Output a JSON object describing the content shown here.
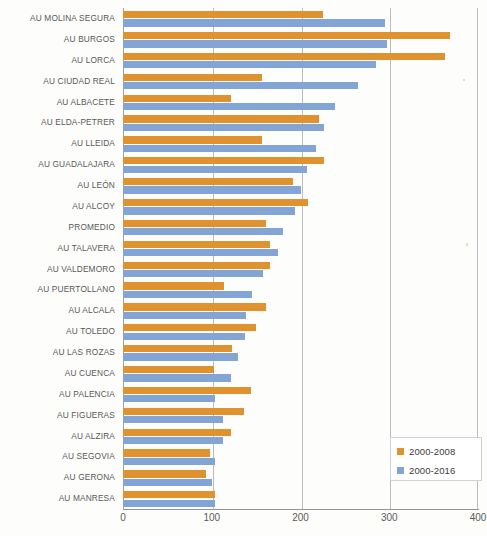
{
  "chart_data": {
    "type": "bar",
    "orientation": "horizontal",
    "title": "",
    "xlabel": "",
    "ylabel": "",
    "xlim": [
      0,
      400
    ],
    "xticks": [
      0,
      100,
      200,
      300,
      400
    ],
    "grid": true,
    "legend_position": "bottom-right",
    "categories": [
      "AU MOLINA SEGURA",
      "AU BURGOS",
      "AU LORCA",
      "AU CIUDAD REAL",
      "AU ALBACETE",
      "AU ELDA-PETRER",
      "AU LLEIDA",
      "AU GUADALAJARA",
      "AU LEÓN",
      "AU ALCOY",
      "PROMEDIO",
      "AU TALAVERA",
      "AU VALDEMORO",
      "AU PUERTOLLANO",
      "AU ALCALA",
      "AU TOLEDO",
      "AU LAS ROZAS",
      "AU CUENCA",
      "AU PALENCIA",
      "AU FIGUERAS",
      "AU ALZIRA",
      "AU SEGOVIA",
      "AU GERONA",
      "AU MANRESA"
    ],
    "series": [
      {
        "name": "2000-2008",
        "color": "#e0922f",
        "values": [
          225,
          368,
          363,
          157,
          122,
          221,
          157,
          226,
          192,
          208,
          161,
          166,
          166,
          114,
          161,
          150,
          123,
          102,
          144,
          136,
          122,
          98,
          94,
          104
        ]
      },
      {
        "name": "2000-2016",
        "color": "#83a5d6",
        "values": [
          295,
          297,
          285,
          265,
          239,
          226,
          217,
          207,
          201,
          194,
          180,
          175,
          158,
          145,
          139,
          138,
          130,
          122,
          104,
          113,
          113,
          104,
          100,
          104
        ]
      }
    ]
  },
  "legend": {
    "items": [
      {
        "label": "2000-2008",
        "color": "#e0922f"
      },
      {
        "label": "2000-2016",
        "color": "#83a5d6"
      }
    ]
  },
  "axis": {
    "x_tick_labels": [
      "0",
      "100",
      "200",
      "300",
      "400"
    ]
  }
}
